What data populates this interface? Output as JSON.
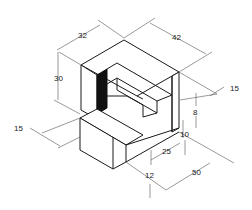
{
  "drawing": {
    "title": "Isometric stepped block",
    "colors": {
      "line": "#1a1a1a",
      "dim": "#555555",
      "shade": "#111111",
      "background": "#ffffff"
    }
  },
  "dimensions": [
    {
      "id": "depth_top",
      "value": "32",
      "x": 57,
      "y": 30
    },
    {
      "id": "width_top",
      "value": "42",
      "x": 170,
      "y": 35
    },
    {
      "id": "height_upper",
      "value": "30",
      "x": 53,
      "y": 74
    },
    {
      "id": "right_offset",
      "value": "15",
      "x": 228,
      "y": 85
    },
    {
      "id": "step_height",
      "value": "8",
      "x": 195,
      "y": 109
    },
    {
      "id": "step_rise",
      "value": "10",
      "x": 176,
      "y": 131
    },
    {
      "id": "left_offset",
      "value": "15",
      "x": 14,
      "y": 127
    },
    {
      "id": "step_depth",
      "value": "25",
      "x": 162,
      "y": 150
    },
    {
      "id": "base_height",
      "value": "12",
      "x": 148,
      "y": 171
    },
    {
      "id": "base_length",
      "value": "50",
      "x": 192,
      "y": 172
    }
  ]
}
